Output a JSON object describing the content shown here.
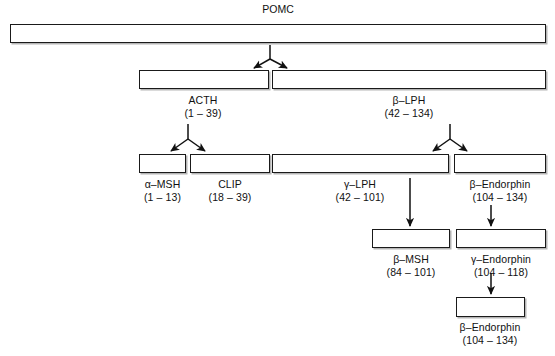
{
  "figure": {
    "type": "flowchart",
    "title": "POMC",
    "background_color": "#ffffff",
    "line_color": "#1a1a1a"
  },
  "nodes": [
    {
      "id": "pomc",
      "name": "POMC",
      "range": "",
      "label_position": "above",
      "box": {
        "x": 10,
        "y": 24,
        "w": 536,
        "h": 19
      }
    },
    {
      "id": "acth",
      "name": "ACTH",
      "range": "(1 – 39)",
      "label_position": "below",
      "box": {
        "x": 139,
        "y": 70,
        "w": 130,
        "h": 19
      }
    },
    {
      "id": "beta-lph",
      "name": "β–LPH",
      "range": "(42 – 134)",
      "label_position": "below",
      "box": {
        "x": 272,
        "y": 70,
        "w": 274,
        "h": 19
      }
    },
    {
      "id": "alpha-msh",
      "name": "α–MSH",
      "range": "(1 – 13)",
      "label_position": "below",
      "box": {
        "x": 139,
        "y": 154,
        "w": 47,
        "h": 19
      }
    },
    {
      "id": "clip",
      "name": "CLIP",
      "range": "(18 – 39)",
      "label_position": "below",
      "box": {
        "x": 190,
        "y": 154,
        "w": 80,
        "h": 19
      }
    },
    {
      "id": "gamma-lph",
      "name": "γ–LPH",
      "range": "(42 – 101)",
      "label_position": "below",
      "box": {
        "x": 272,
        "y": 154,
        "w": 177,
        "h": 19
      }
    },
    {
      "id": "beta-endorphin-1",
      "name": "β–Endorphin",
      "range": "(104 – 134)",
      "label_position": "below",
      "box": {
        "x": 454,
        "y": 154,
        "w": 92,
        "h": 19
      }
    },
    {
      "id": "beta-msh",
      "name": "β–MSH",
      "range": "(84 – 101)",
      "label_position": "below",
      "box": {
        "x": 372,
        "y": 229,
        "w": 78,
        "h": 19
      }
    },
    {
      "id": "gamma-endorphin",
      "name": "γ–Endorphin",
      "range": "(104 – 118)",
      "label_position": "below",
      "box": {
        "x": 456,
        "y": 229,
        "w": 90,
        "h": 19
      }
    },
    {
      "id": "beta-endorphin-2",
      "name": "β–Endorphin",
      "range": "(104 – 134)",
      "label_position": "below",
      "box": {
        "x": 456,
        "y": 297,
        "w": 69,
        "h": 20
      }
    }
  ],
  "connections": [
    {
      "id": "split-pomc",
      "kind": "split",
      "from": "pomc",
      "to": [
        "acth",
        "beta-lph"
      ]
    },
    {
      "id": "split-acth",
      "kind": "split",
      "from": "acth",
      "to": [
        "alpha-msh",
        "clip"
      ]
    },
    {
      "id": "split-beta-lph",
      "kind": "split",
      "from": "beta-lph",
      "to": [
        "gamma-lph",
        "beta-endorphin-1"
      ]
    },
    {
      "id": "arrow-gamma-lph-to-beta-msh",
      "kind": "straight",
      "from": "gamma-lph",
      "to": "beta-msh"
    },
    {
      "id": "arrow-beta-endorphin-to-gamma-endorphin",
      "kind": "straight",
      "from": "beta-endorphin-1",
      "to": "gamma-endorphin"
    },
    {
      "id": "arrow-gamma-endorphin-to-beta-endorphin",
      "kind": "straight",
      "from": "gamma-endorphin",
      "to": "beta-endorphin-2"
    }
  ]
}
